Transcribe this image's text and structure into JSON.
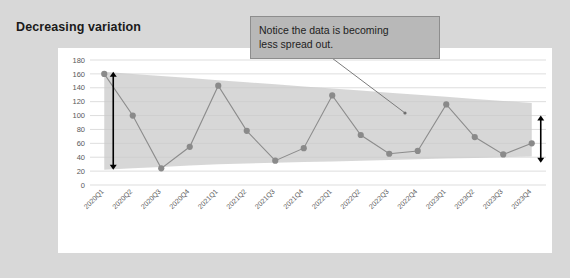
{
  "page": {
    "title": "Decreasing variation",
    "background_color": "#d8d8d8",
    "panel_color": "#ffffff"
  },
  "callout": {
    "line1": "Notice the data is becoming",
    "line2": "less spread out.",
    "fill_color": "#b8b8b8",
    "border_color": "#8d8d8d"
  },
  "annotations": {
    "left_arrow": {
      "label": "left-variation-arrow",
      "top_value": 163,
      "bottom_value": 22
    },
    "right_arrow": {
      "label": "right-variation-arrow",
      "top_value": 100,
      "bottom_value": 32
    },
    "leader_line": {
      "label": "callout-leader-line"
    }
  },
  "chart_data": {
    "type": "line",
    "title": "",
    "xlabel": "",
    "ylabel": "",
    "ylim": [
      0,
      180
    ],
    "yticks": [
      0,
      20,
      40,
      60,
      80,
      100,
      120,
      140,
      160,
      180
    ],
    "grid": true,
    "legend": "none",
    "marker": "circle",
    "line_color": "#8c8c8c",
    "marker_color": "#8a8a8a",
    "band_color": "#c9c9c9",
    "categories": [
      "2020Q1",
      "2020Q2",
      "2020Q3",
      "2020Q4",
      "2021Q1",
      "2021Q2",
      "2021Q3",
      "2021Q4",
      "2022Q1",
      "2022Q2",
      "2022Q3",
      "2022Q4",
      "2023Q1",
      "2023Q2",
      "2023Q3",
      "2023Q4"
    ],
    "values": [
      160,
      100,
      24,
      55,
      143,
      78,
      35,
      53,
      129,
      72,
      45,
      49,
      116,
      69,
      44,
      60
    ],
    "band_upper": [
      163,
      160,
      157,
      154,
      151,
      148,
      145,
      142,
      139,
      136,
      133,
      130,
      127,
      124,
      121,
      118
    ],
    "band_lower": [
      22,
      24,
      26,
      28,
      30,
      31,
      32,
      33,
      34,
      35,
      36,
      37,
      38,
      39,
      40,
      41
    ]
  }
}
